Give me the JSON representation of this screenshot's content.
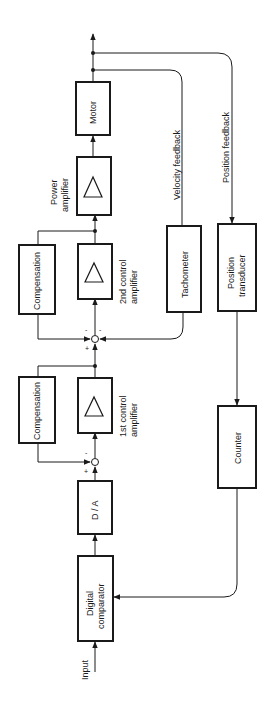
{
  "diagram": {
    "type": "block-diagram",
    "orientation": "rotated-90-ccw",
    "blocks": {
      "digital_comparator": {
        "line1": "Digital",
        "line2": "comparator"
      },
      "da": {
        "label": "D / A"
      },
      "compensation_1": {
        "label": "Compensation"
      },
      "control_amp_1": {
        "line1": "1st  control",
        "line2": "amplifier"
      },
      "compensation_2": {
        "label": "Compensation"
      },
      "control_amp_2": {
        "line1": "2nd  control",
        "line2": "amplifier"
      },
      "power_amp": {
        "line1": "Power",
        "line2": "amplifier"
      },
      "motor": {
        "label": "Motor"
      },
      "tachometer": {
        "label": "Tachometer"
      },
      "position_transducer": {
        "line1": "Position",
        "line2": "transducer"
      },
      "counter": {
        "label": "Counter"
      }
    },
    "labels": {
      "input": "Input",
      "velocity_feedback": "Velocity  feedback",
      "position_feedback": "Position  feedback"
    },
    "signs": {
      "j1_plus": "+",
      "j1_minus": "-",
      "j2_plus": "+",
      "j2_minus_a": "-",
      "j2_minus_b": "-"
    },
    "colors": {
      "ink": "#1a1a1a",
      "background": "#ffffff"
    }
  }
}
